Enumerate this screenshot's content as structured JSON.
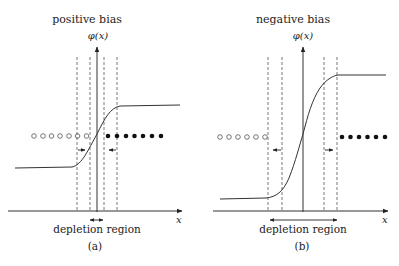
{
  "panels": [
    {
      "id": "a",
      "title": "positive bias",
      "y_axis_label": "φ(x)",
      "x_axis_label": "x",
      "region_label": "depletion region",
      "caption": "(a)",
      "open_circles": 7,
      "filled_dots": 7,
      "depletion_arrow_direction": "inward",
      "curve": "sigmoid rising from low plateau (left) to high plateau (right), gentle slope"
    },
    {
      "id": "b",
      "title": "negative bias",
      "y_axis_label": "φ(x)",
      "x_axis_label": "x",
      "region_label": "depletion region",
      "caption": "(b)",
      "open_circles": 6,
      "filled_dots": 6,
      "depletion_arrow_direction": "outward",
      "curve": "sigmoid rising from low plateau (left) to high plateau (right), steep slope"
    }
  ],
  "colors": {
    "line": "#333333",
    "dashed": "#555555",
    "background": "#ffffff"
  }
}
